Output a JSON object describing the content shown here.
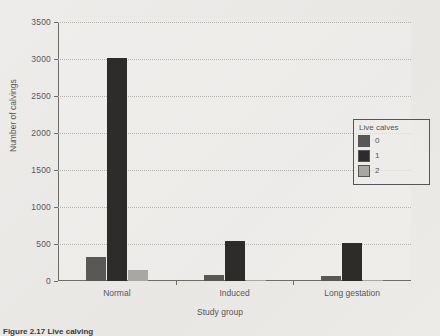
{
  "chart_data": {
    "type": "bar",
    "title": "",
    "xlabel": "Study group",
    "ylabel": "Number of calvings",
    "categories": [
      "Normal",
      "Induced",
      "Long gestation"
    ],
    "series": [
      {
        "name": "0",
        "values": [
          330,
          80,
          70
        ],
        "color": "#595857"
      },
      {
        "name": "1",
        "values": [
          3010,
          540,
          510
        ],
        "color": "#2d2c2b"
      },
      {
        "name": "2",
        "values": [
          150,
          15,
          10
        ],
        "color": "#a9a7a4"
      }
    ],
    "ylim": [
      0,
      3500
    ],
    "yticks": [
      0,
      500,
      1000,
      1500,
      2000,
      2500,
      3000,
      3500
    ],
    "ytick_labels": [
      "0",
      "500",
      "1000",
      "1500",
      "2000",
      "2500",
      "3000",
      "3500"
    ],
    "grid": "horizontal-dotted",
    "legend": {
      "title": "Live calves",
      "position": "right",
      "entries": [
        "0",
        "1",
        "2"
      ]
    }
  },
  "figure": {
    "caption": "Figure 2.17  Live calving"
  },
  "colors": {
    "background": "#eceae7",
    "axis": "#6f6c68",
    "grid": "#b5b2ae",
    "text": "#58565a"
  }
}
